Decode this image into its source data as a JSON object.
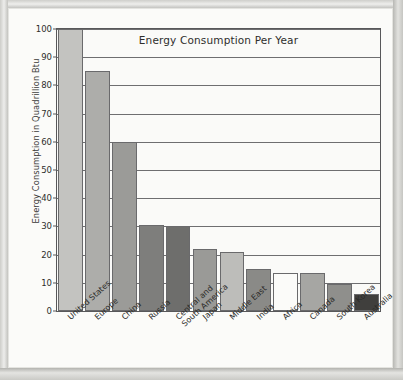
{
  "chart_data": {
    "type": "bar",
    "title": "Energy Consumption Per Year",
    "xlabel": "",
    "ylabel": "Energy Consumption in Quadrillion Btu",
    "ylim": [
      0,
      100
    ],
    "yticks": [
      0,
      10,
      20,
      30,
      40,
      50,
      60,
      70,
      80,
      90,
      100
    ],
    "grid": true,
    "legend": "none",
    "categories": [
      "United States",
      "Europe",
      "China",
      "Russia",
      "Central and\nSouth America",
      "Japan",
      "Middle East",
      "India",
      "Africa",
      "Canada",
      "South Korea",
      "Australia"
    ],
    "values": [
      100,
      85,
      60,
      30.5,
      30,
      22,
      21,
      15,
      13.5,
      13.5,
      9.5,
      6
    ],
    "bar_colors": [
      "#c3c3c0",
      "#adadaa",
      "#9b9b98",
      "#7e7e7c",
      "#6e6e6c",
      "#9a9a97",
      "#bdbdba",
      "#8a8a87",
      "#fbfbf9",
      "#a6a6a3",
      "#8f8f8c",
      "#403f3d"
    ]
  },
  "colors": {
    "axis": "#58585a",
    "grid": "#6e6e70",
    "text": "#2e2e2c",
    "plot_background": "#fafaf8",
    "page_background": "#fbfbf9",
    "frame": "#c9c9c6"
  }
}
